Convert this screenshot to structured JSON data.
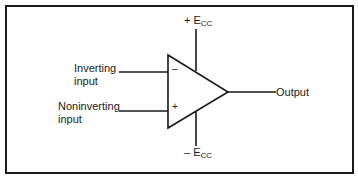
{
  "diagram": {
    "type": "op-amp schematic",
    "inputs": {
      "inverting": {
        "label_line1": "Inverting",
        "label_line2": "input",
        "pin_symbol": "–"
      },
      "noninverting": {
        "label_line1": "Noninverting",
        "label_line2": "input",
        "pin_symbol": "+"
      }
    },
    "output": {
      "label": "Output"
    },
    "supply": {
      "positive": {
        "sign": "+ E",
        "subscript": "CC"
      },
      "negative": {
        "sign": "– E",
        "subscript": "CC"
      }
    },
    "colors": {
      "line": "#1a1a1a",
      "background": "#ffffff"
    }
  }
}
